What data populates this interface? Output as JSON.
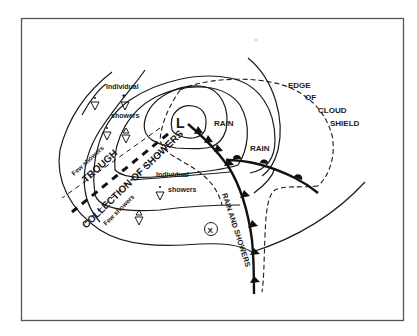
{
  "diagram": {
    "labels": {
      "low_center": "L",
      "rain_1": "RAIN",
      "rain_2": "RAIN",
      "cloud_edge_1": "EDGE",
      "cloud_edge_2": "OF",
      "cloud_edge_3": "CLOUD",
      "cloud_edge_4": "SHIELD",
      "individual_top": "Individual",
      "showers_top": "showers",
      "individual_mid": "Individual",
      "showers_mid": "showers",
      "few_showers_left": "Few showers",
      "few_showers_bottom": "Few showers",
      "trough": "TROUGH",
      "collection": "COLLECTION OF SHOWERS",
      "rain_and_showers": "RAIN AND SHOWERS",
      "point_marker": "X"
    },
    "symbols": {
      "shower": "shower-triangle-icon",
      "snow_shower": "snow-shower-icon",
      "hail_shower": "hail-shower-icon"
    },
    "colors": {
      "ink": "#1a1a1a",
      "background": "#ffffff",
      "frame": "#555555"
    }
  }
}
